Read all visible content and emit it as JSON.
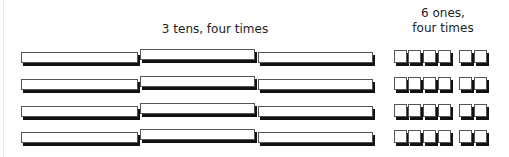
{
  "labels": {
    "tens": "3 tens, four times",
    "ones_line1": "6 ones,",
    "ones_line2": "four times"
  },
  "diagram": {
    "rows": 4,
    "tens_per_row": 3,
    "ones_per_row": 6,
    "ones_grouping": [
      4,
      2
    ],
    "represents": "4 × 36"
  },
  "colors": {
    "block_fill": "#ffffff",
    "block_border": "#555555",
    "block_shadow": "#111111"
  }
}
